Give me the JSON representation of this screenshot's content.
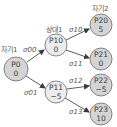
{
  "diagram": {
    "type": "game-tree",
    "colors": {
      "self_node_fill": "#d4d4d4",
      "opponent_node_fill": "#ececec",
      "node_stroke": "#6b6b6b",
      "edge": "#4a4a4a",
      "text": "#3a3a3a"
    },
    "level_labels": {
      "self1": "자기1",
      "opponent1": "상대1",
      "self2": "자기2"
    },
    "nodes": [
      {
        "id": "P0",
        "name": "P0",
        "value": "0"
      },
      {
        "id": "P10",
        "name": "P10",
        "value": "0"
      },
      {
        "id": "P11",
        "name": "P11",
        "value": "−5"
      },
      {
        "id": "P20",
        "name": "P20",
        "value": "5"
      },
      {
        "id": "P21",
        "name": "P21",
        "value": "0"
      },
      {
        "id": "P22",
        "name": "P22",
        "value": "−5"
      },
      {
        "id": "P23",
        "name": "P23",
        "value": "10"
      }
    ],
    "edges": [
      {
        "from": "P0",
        "to": "P10",
        "label": "σ00"
      },
      {
        "from": "P0",
        "to": "P11",
        "label": "σ01"
      },
      {
        "from": "P10",
        "to": "P20",
        "label": "σ10"
      },
      {
        "from": "P10",
        "to": "P21",
        "label": "σ11"
      },
      {
        "from": "P11",
        "to": "P22",
        "label": "σ12"
      },
      {
        "from": "P11",
        "to": "P23",
        "label": "σ13"
      }
    ]
  }
}
